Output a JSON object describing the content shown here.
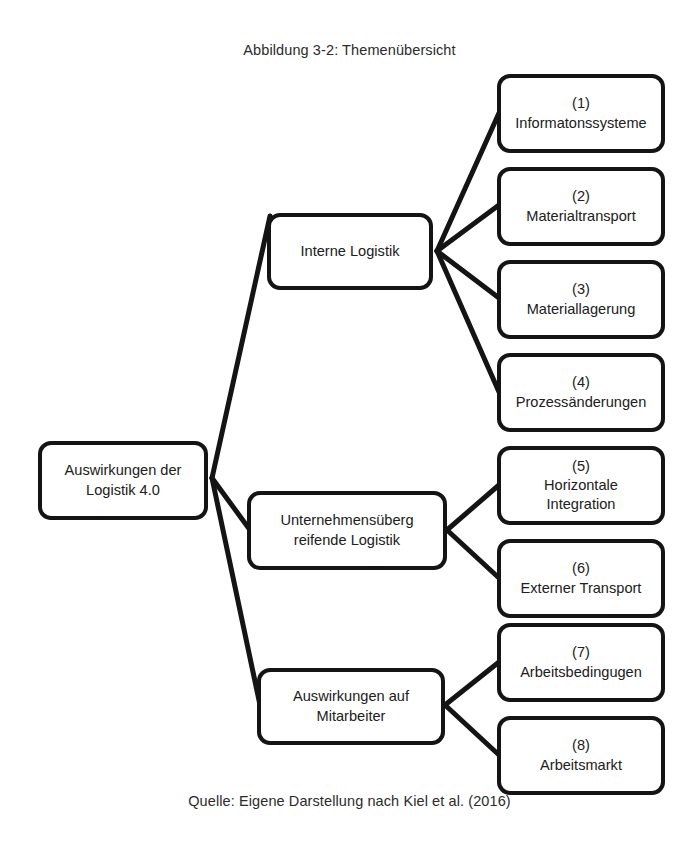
{
  "figure": {
    "title": "Abbildung 3-2: Themenübersicht",
    "source": "Quelle: Eigene Darstellung nach Kiel et al. (2016)"
  },
  "diagram": {
    "type": "tree",
    "orientation": "left-to-right",
    "style": {
      "box_border_color": "#141414",
      "box_fill_color": "#ffffff",
      "edge_color": "#141414",
      "text_color": "#202020"
    },
    "root": {
      "id": "root",
      "label": "Auswirkungen der\nLogistik 4.0"
    },
    "branches": [
      {
        "id": "branch-1",
        "label": "Interne Logistik",
        "leaves": [
          {
            "id": "leaf-1",
            "number": "(1)",
            "name": "Informatonssysteme",
            "label": "(1)\nInformatonssysteme"
          },
          {
            "id": "leaf-2",
            "number": "(2)",
            "name": "Materialtransport",
            "label": "(2)\nMaterialtransport"
          },
          {
            "id": "leaf-3",
            "number": "(3)",
            "name": "Materiallagerung",
            "label": "(3)\nMateriallagerung"
          },
          {
            "id": "leaf-4",
            "number": "(4)",
            "name": "Prozessänderungen",
            "label": "(4)\nProzessänderungen"
          }
        ]
      },
      {
        "id": "branch-2",
        "label": "Unternehmensüberg\nreifende Logistik",
        "leaves": [
          {
            "id": "leaf-5",
            "number": "(5)",
            "name": "Horizontale Integration",
            "label": "(5)\nHorizontale\nIntegration"
          },
          {
            "id": "leaf-6",
            "number": "(6)",
            "name": "Externer Transport",
            "label": "(6)\nExterner Transport"
          }
        ]
      },
      {
        "id": "branch-3",
        "label": "Auswirkungen auf\nMitarbeiter",
        "leaves": [
          {
            "id": "leaf-7",
            "number": "(7)",
            "name": "Arbeitsbedingugen",
            "label": "(7)\nArbeitsbedingugen"
          },
          {
            "id": "leaf-8",
            "number": "(8)",
            "name": "Arbeitsmarkt",
            "label": "(8)\nArbeitsmarkt"
          }
        ]
      }
    ]
  }
}
